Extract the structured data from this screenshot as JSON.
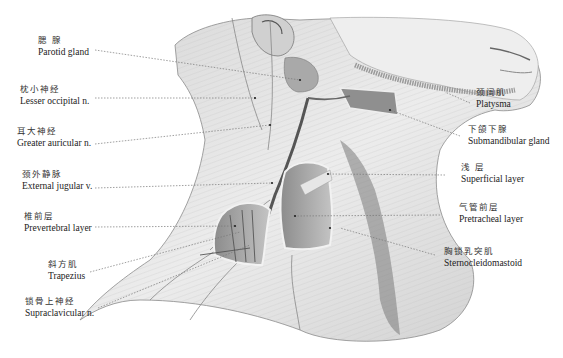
{
  "figure": {
    "colors": {
      "skin": "#e6e6e6",
      "shadow": "#9a9a9a",
      "dark": "#555555",
      "leader": "#777777",
      "background": "#ffffff"
    }
  },
  "labels": {
    "parotid": {
      "zh": "腮  腺",
      "en": "Parotid gland"
    },
    "lesser_occipital": {
      "zh": "枕小神经",
      "en": "Lesser occipital n."
    },
    "greater_auricular": {
      "zh": "耳大神经",
      "en": "Greater auricular n."
    },
    "external_jugular": {
      "zh": "颈外静脉",
      "en": "External jugular v."
    },
    "prevertebral": {
      "zh": "椎前层",
      "en": "Prevertebral layer"
    },
    "trapezius": {
      "zh": "斜方肌",
      "en": "Trapezius"
    },
    "supraclavicular": {
      "zh": "锁骨上神经",
      "en": "Supraclavicular n."
    },
    "platysma": {
      "zh": "颈阔肌",
      "en": "Platysma"
    },
    "submandibular": {
      "zh": "下颌下腺",
      "en": "Submandibular gland"
    },
    "superficial": {
      "zh": "浅  层",
      "en": "Superficial layer"
    },
    "pretracheal": {
      "zh": "气管前层",
      "en": "Pretracheal layer"
    },
    "sternocleidomastoid": {
      "zh": "胸锁乳突肌",
      "en": "Sternocleidomastoid"
    }
  }
}
